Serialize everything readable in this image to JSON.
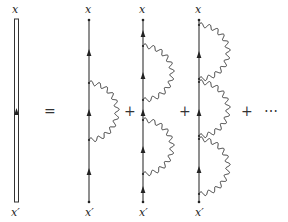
{
  "labels": {
    "top": "x",
    "bottom": "x′"
  },
  "operators": {
    "equals": "=",
    "plus": "+",
    "ellipsis": "⋯"
  },
  "diagrams": [
    {
      "name": "dressed-propagator",
      "kind": "double-line",
      "loops": 0
    },
    {
      "name": "one-loop",
      "kind": "single-line",
      "loops": 1
    },
    {
      "name": "two-loop",
      "kind": "single-line",
      "loops": 2
    },
    {
      "name": "three-loop",
      "kind": "single-line",
      "loops": 3
    }
  ],
  "colors": {
    "line": "#333333",
    "background": "#ffffff"
  }
}
